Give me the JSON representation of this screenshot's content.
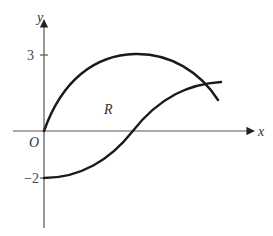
{
  "diagram": {
    "type": "coordinate-graph",
    "axes": {
      "x_label": "x",
      "y_label": "y",
      "origin_label": "O"
    },
    "ticks": {
      "y_upper": "3",
      "y_lower": "−2"
    },
    "region_label": "R",
    "curves": [
      {
        "name": "upper-curve",
        "description": "starts at origin, rises to max y=3, then descends crossing the lower curve"
      },
      {
        "name": "lower-curve",
        "description": "starts at y=-2 on y-axis, rises through x-axis, levels off near the end"
      }
    ],
    "colors": {
      "curve": "#1a1a1a",
      "axis": "#555555",
      "background": "#ffffff"
    }
  }
}
